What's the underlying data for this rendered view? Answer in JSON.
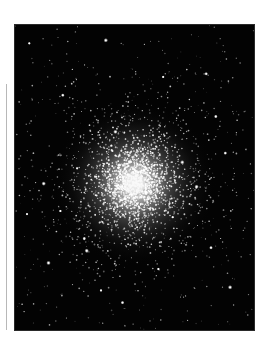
{
  "image": {
    "subject": "Globular star cluster",
    "description": "Black-and-white astronomical photograph of a dense globular cluster of stars against a black sky",
    "palette": {
      "sky": "#030303",
      "star": "#ffffff",
      "core_glow": "#f4f4f4",
      "rule": "#b8b8b8",
      "page": "#ffffff"
    },
    "cluster": {
      "core_center_fraction": [
        0.5,
        0.52
      ],
      "core_radius_fraction": 0.1,
      "halo_radius_fraction": 0.33,
      "star_count_dense": 2200,
      "star_count_field": 420,
      "seed": 7
    },
    "bright_stars_fraction": [
      [
        0.06,
        0.06
      ],
      [
        0.2,
        0.23
      ],
      [
        0.38,
        0.05
      ],
      [
        0.26,
        0.47
      ],
      [
        0.55,
        0.47
      ],
      [
        0.7,
        0.45
      ],
      [
        0.62,
        0.17
      ],
      [
        0.8,
        0.16
      ],
      [
        0.12,
        0.52
      ],
      [
        0.05,
        0.62
      ],
      [
        0.29,
        0.7
      ],
      [
        0.3,
        0.74
      ],
      [
        0.19,
        0.61
      ],
      [
        0.88,
        0.42
      ],
      [
        0.76,
        0.53
      ],
      [
        0.6,
        0.8
      ],
      [
        0.82,
        0.73
      ],
      [
        0.9,
        0.86
      ],
      [
        0.36,
        0.87
      ],
      [
        0.45,
        0.91
      ],
      [
        0.14,
        0.78
      ],
      [
        0.66,
        0.63
      ],
      [
        0.84,
        0.3
      ],
      [
        0.42,
        0.35
      ]
    ]
  }
}
